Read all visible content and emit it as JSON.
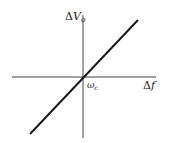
{
  "diagram": {
    "type": "transfer-characteristic",
    "y_axis": {
      "symbol": "Δ",
      "var": "V",
      "sub": "o"
    },
    "x_axis": {
      "symbol": "Δ",
      "var": "f"
    },
    "origin_label": {
      "var": "ω",
      "sub": "c"
    },
    "line": {
      "kind": "linear",
      "through_origin": true,
      "slope": "positive"
    },
    "colors": {
      "axis": "#333333",
      "line": "#1a1a1a",
      "background": "#ffffff"
    }
  }
}
